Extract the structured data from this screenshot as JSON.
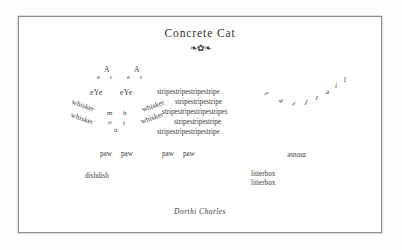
{
  "poem": {
    "title": "Concrete Cat",
    "ornament": "❧✿❧",
    "author": "Dorthi Charles"
  },
  "ears": [
    {
      "top": "A",
      "left": "e",
      "right": "r"
    },
    {
      "top": "A",
      "left": "e",
      "right": "r"
    }
  ],
  "eyes": [
    {
      "text": "eYe"
    },
    {
      "text": "eYe"
    }
  ],
  "whiskers": [
    {
      "text": "whisker",
      "side": "left"
    },
    {
      "text": "whisker",
      "side": "left"
    },
    {
      "text": "whisker",
      "side": "right"
    },
    {
      "text": "whisker",
      "side": "right"
    }
  ],
  "mouth": [
    {
      "letter": "m"
    },
    {
      "letter": "o"
    },
    {
      "letter": "u"
    },
    {
      "letter": "t"
    },
    {
      "letter": "h"
    }
  ],
  "stripes": [
    {
      "text": "stripestripestripestripe"
    },
    {
      "text": "stripestripestripe"
    },
    {
      "text": "stripestripestripestripes"
    },
    {
      "text": "stripestripestripe"
    },
    {
      "text": "stripestripestripestripe"
    }
  ],
  "tail": [
    {
      "letter": "t"
    },
    {
      "letter": "a"
    },
    {
      "letter": "i"
    },
    {
      "letter": "l"
    }
  ],
  "paws": [
    {
      "text": "paw"
    },
    {
      "text": "paw"
    },
    {
      "text": "paw"
    },
    {
      "text": "paw"
    }
  ],
  "mouse": {
    "text": "mouse"
  },
  "dishes": [
    {
      "text": "dishdish"
    }
  ],
  "litterbox": [
    {
      "text": "litterbox"
    },
    {
      "text": "litterbox"
    }
  ],
  "colors": {
    "ink": "#3c3c3c",
    "frame": "#8c8c8c",
    "paper": "#ffffff"
  }
}
